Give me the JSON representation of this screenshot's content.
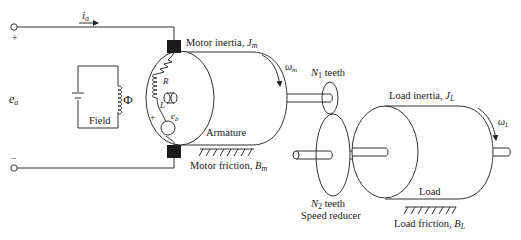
{
  "diagram": {
    "circuit": {
      "current_label": "i",
      "current_sub": "a",
      "voltage_label": "e",
      "voltage_sub": "a",
      "plus_sign": "+",
      "minus_sign": "−",
      "field_label": "Field",
      "flux_symbol": "Φ"
    },
    "armature": {
      "resistance": "R",
      "inductance": "L",
      "back_emf": "e",
      "back_emf_sub": "b",
      "plus_sign": "+",
      "minus_sign": "−",
      "label": "Armature"
    },
    "motor": {
      "inertia_label": "Motor inertia, ",
      "inertia_sym": "J",
      "inertia_sub": "m",
      "speed_sym": "ω",
      "speed_sub": "m",
      "friction_label": "Motor friction, ",
      "friction_sym": "B",
      "friction_sub": "m"
    },
    "reducer": {
      "gear1_sym": "N",
      "gear1_sub": "1",
      "gear1_suffix": " teeth",
      "gear2_sym": "N",
      "gear2_sub": "2",
      "gear2_suffix": " teeth",
      "label": "Speed reducer"
    },
    "load": {
      "inertia_label": "Load inertia, ",
      "inertia_sym": "J",
      "inertia_sub": "L",
      "speed_sym": "ω",
      "speed_sub": "L",
      "label": "Load",
      "friction_label": "Load friction, ",
      "friction_sym": "B",
      "friction_sub": "L"
    }
  }
}
